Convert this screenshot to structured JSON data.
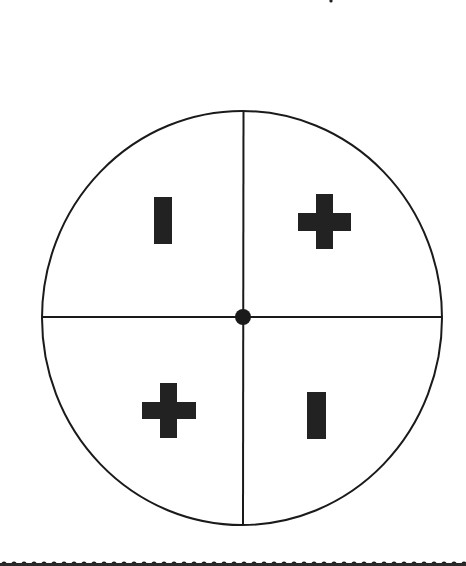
{
  "figure": {
    "colors": {
      "stroke": "#1a1a1a",
      "fill": "#222222",
      "background": "#ffffff"
    },
    "circle": {
      "cx": 242,
      "cy": 318,
      "rx": 200,
      "ry": 207
    },
    "center_dot": {
      "cx": 243,
      "cy": 317,
      "r": 8
    },
    "quadrants": [
      {
        "position": "top-left",
        "symbol": "minus",
        "orientation": "vertical"
      },
      {
        "position": "top-right",
        "symbol": "plus"
      },
      {
        "position": "bottom-left",
        "symbol": "plus"
      },
      {
        "position": "bottom-right",
        "symbol": "minus",
        "orientation": "vertical"
      }
    ]
  },
  "border": {
    "style": "dotted",
    "position": "bottom"
  }
}
